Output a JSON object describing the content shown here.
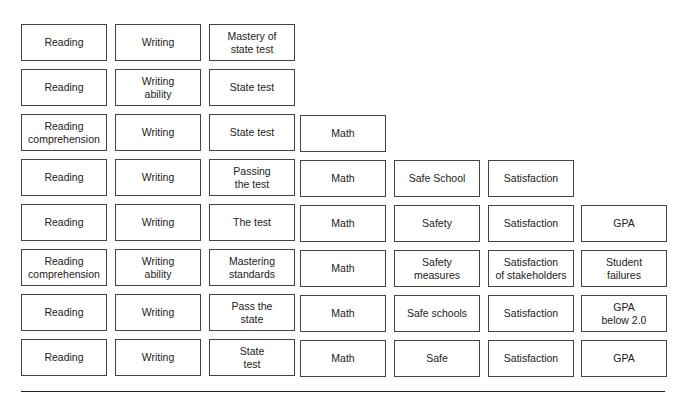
{
  "diagram": {
    "rows": [
      [
        "Reading",
        "Writing",
        "Mastery of\nstate test"
      ],
      [
        "Reading",
        "Writing\nability",
        "State test"
      ],
      [
        "Reading\ncomprehension",
        "Writing",
        "State test",
        "Math"
      ],
      [
        "Reading",
        "Writing",
        "Passing\nthe test",
        "Math",
        "Safe School",
        "Satisfaction"
      ],
      [
        "Reading",
        "Writing",
        "The test",
        "Math",
        "Safety",
        "Satisfaction",
        "GPA"
      ],
      [
        "Reading\ncomprehension",
        "Writing\nability",
        "Mastering\nstandards",
        "Math",
        "Safety\nmeasures",
        "Satisfaction\nof stakeholders",
        "Student\nfailures"
      ],
      [
        "Reading",
        "Writing",
        "Pass the\nstate",
        "Math",
        "Safe schools",
        "Satisfaction",
        "GPA\nbelow 2.0"
      ],
      [
        "Reading",
        "Writing",
        "State\ntest",
        "Math",
        "Safe",
        "Satisfaction",
        "GPA"
      ]
    ]
  }
}
